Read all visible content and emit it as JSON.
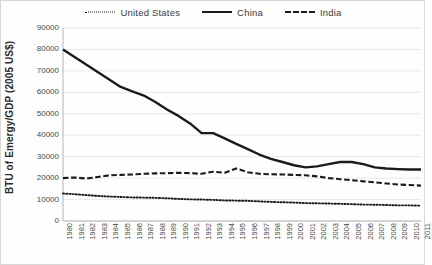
{
  "chart_data": {
    "type": "line",
    "title": "",
    "xlabel": "",
    "ylabel": "BTU of Emergy/GDP (2005 US$)",
    "ylim": [
      0,
      90000
    ],
    "ytick_values": [
      0,
      10000,
      20000,
      30000,
      40000,
      50000,
      60000,
      70000,
      80000,
      90000
    ],
    "ytick_labels": [
      "0",
      "10000",
      "20000",
      "30000",
      "40000",
      "50000",
      "60000",
      "70000",
      "80000",
      "90000"
    ],
    "grid": "horizontal",
    "legend_position": "top-center",
    "categories": [
      "1980",
      "1981",
      "1982",
      "1983",
      "1984",
      "1985",
      "1986",
      "1987",
      "1988",
      "1989",
      "1990",
      "1991",
      "1992",
      "1993",
      "1994",
      "1995",
      "1996",
      "1997",
      "1998",
      "1999",
      "2000",
      "2001",
      "2002",
      "2003",
      "2004",
      "2005",
      "2006",
      "2007",
      "2008",
      "2009",
      "2010",
      "2011"
    ],
    "series": [
      {
        "name": "United States",
        "style": "dotted",
        "color": "#1b1b1b",
        "values": [
          12800,
          12500,
          12100,
          11700,
          11400,
          11200,
          11000,
          10900,
          10800,
          10600,
          10300,
          10100,
          10000,
          9850,
          9600,
          9500,
          9400,
          9150,
          8900,
          8750,
          8600,
          8350,
          8250,
          8150,
          8000,
          7850,
          7650,
          7600,
          7450,
          7300,
          7300,
          7150
        ]
      },
      {
        "name": "China",
        "style": "solid",
        "color": "#1b1b1b",
        "values": [
          80000,
          76500,
          73000,
          69500,
          66000,
          62500,
          60500,
          58500,
          55500,
          52000,
          49000,
          45500,
          41000,
          41000,
          38500,
          36000,
          33500,
          31000,
          29000,
          27500,
          26000,
          25000,
          25500,
          26500,
          27500,
          27500,
          26500,
          25000,
          24500,
          24200,
          24000,
          24000
        ]
      },
      {
        "name": "India",
        "style": "dashed",
        "color": "#1b1b1b",
        "values": [
          20000,
          20300,
          19800,
          20500,
          21300,
          21500,
          21700,
          22000,
          22200,
          22300,
          22500,
          22300,
          22000,
          23000,
          22500,
          24500,
          22700,
          22000,
          21800,
          21700,
          21500,
          21300,
          20800,
          20000,
          19500,
          19000,
          18500,
          18000,
          17500,
          17000,
          16800,
          16500
        ]
      }
    ]
  },
  "legend": {
    "items": [
      {
        "label": "United States",
        "icon": "dotted-line-swatch"
      },
      {
        "label": "China",
        "icon": "solid-line-swatch"
      },
      {
        "label": "India",
        "icon": "dashed-line-swatch"
      }
    ]
  }
}
